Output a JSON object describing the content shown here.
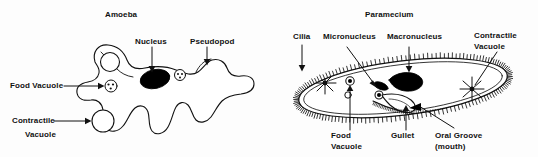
{
  "figure": {
    "caption_style": "biology-textbook-line-drawing",
    "background_color": "#fdfdfd",
    "ink_color": "#111111"
  },
  "amoeba": {
    "title": "Amoeba",
    "labels": {
      "nucleus": "Nucleus",
      "pseudopod": "Pseudopod",
      "food_vacuole": "Food Vacuole",
      "contractile_line1": "Contractile",
      "contractile_line2": "Vacuole"
    },
    "structures": [
      {
        "name": "nucleus",
        "shape": "filled-ellipse",
        "fill": "#000000"
      },
      {
        "name": "food-vacuole",
        "shape": "small-circle-with-dots",
        "fill": "#ffffff"
      },
      {
        "name": "contractile-vacuole",
        "shape": "large-open-circle",
        "fill": "#ffffff"
      },
      {
        "name": "pseudopod",
        "shape": "lobed-projection",
        "fill": "#ffffff"
      }
    ]
  },
  "paramecium": {
    "title": "Paramecium",
    "labels": {
      "cilia": "Cilia",
      "micronucleus": "Micronucleus",
      "macronucleus": "Macronucleus",
      "contractile_line1": "Contractile",
      "contractile_line2": "Vacuole",
      "food_line1": "Food",
      "food_line2": "Vacuole",
      "gullet": "Gullet",
      "oral_line1": "Oral Groove",
      "oral_line2": "(mouth)"
    },
    "structures": [
      {
        "name": "cilia",
        "shape": "hair-fringe",
        "fill": "#000000"
      },
      {
        "name": "macronucleus",
        "shape": "filled-bean",
        "fill": "#000000"
      },
      {
        "name": "micronucleus",
        "shape": "small-filled-oval",
        "fill": "#000000"
      },
      {
        "name": "contractile-vacuole-left",
        "shape": "radiating-star",
        "fill": "#ffffff"
      },
      {
        "name": "contractile-vacuole-right",
        "shape": "radiating-star",
        "fill": "#ffffff"
      },
      {
        "name": "food-vacuole",
        "shape": "small-circle-dark",
        "fill": "#000000"
      },
      {
        "name": "gullet",
        "shape": "funnel",
        "fill": "#ffffff"
      },
      {
        "name": "oral-groove",
        "shape": "indented-channel",
        "fill": "#ffffff"
      }
    ]
  }
}
